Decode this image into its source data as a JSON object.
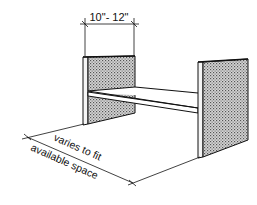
{
  "diagram": {
    "type": "shelf-dimension-illustration",
    "labels": {
      "depth": "10\"- 12\"",
      "width_line1": "varies to fit",
      "width_line2": "available space"
    },
    "colors": {
      "ink": "#111111",
      "panel_fill": "#bdbdbd",
      "background": "#ffffff"
    },
    "parts": [
      "left-side-panel",
      "shelf-board",
      "right-side-panel"
    ]
  }
}
